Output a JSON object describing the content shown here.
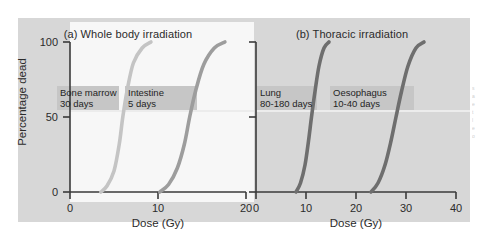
{
  "figure": {
    "y_axis_label": "Percentage dead",
    "y_ticks": [
      "0",
      "50",
      "100"
    ]
  },
  "panel_a": {
    "title": "(a) Whole body irradiation",
    "x_axis_label": "Dose (Gy)",
    "x_ticks": [
      "0",
      "10",
      "20"
    ],
    "curve1_caption": "Bone marrow\n30 days",
    "curve2_caption": "Intestine\n5 days"
  },
  "panel_b": {
    "title": "(b) Thoracic irradiation",
    "x_axis_label": "Dose (Gy)",
    "x_ticks": [
      "0",
      "10",
      "20",
      "30",
      "40"
    ],
    "curve1_caption": "Lung\n80-180 days",
    "curve2_caption": "Oesophagus\n10-40 days"
  },
  "colors": {
    "plate_background": "#d7d7d7",
    "panel_a_background": "#f7f7f7",
    "label_band": "#c6c6c6",
    "axis": "#3a3a3a",
    "curve_bone_marrow": "#c4c4c4",
    "curve_intestine": "#9d9d9d",
    "curve_lung": "#6e6e6e",
    "curve_oesophagus": "#6e6e6e",
    "text": "#2b2b2b"
  },
  "margin_text": [
    "s",
    "a",
    "e",
    "t",
    "l",
    "e",
    "o"
  ],
  "chart_data": {
    "type": "line",
    "panels": [
      {
        "label": "(a) Whole body irradiation",
        "xlabel": "Dose (Gy)",
        "ylabel": "Percentage dead",
        "xlim": [
          0,
          20
        ],
        "ylim": [
          0,
          100
        ],
        "xticks": [
          0,
          10,
          20
        ],
        "yticks": [
          0,
          50,
          100
        ],
        "grid": false,
        "series": [
          {
            "name": "Bone marrow",
            "annotation": "30 days",
            "color": "#c4c4c4",
            "x": [
              3.5,
              4.2,
              5.0,
              5.6,
              6.0,
              6.5,
              7.2,
              8.2,
              9.2
            ],
            "y": [
              0,
              4,
              14,
              32,
              50,
              68,
              86,
              96,
              100
            ]
          },
          {
            "name": "Intestine",
            "annotation": "5 days",
            "color": "#9d9d9d",
            "x": [
              10.2,
              11.2,
              12.2,
              13.0,
              13.6,
              14.3,
              15.2,
              16.4,
              17.6
            ],
            "y": [
              0,
              5,
              16,
              32,
              50,
              68,
              85,
              96,
              100
            ]
          }
        ]
      },
      {
        "label": "(b) Thoracic irradiation",
        "xlabel": "Dose (Gy)",
        "ylabel": "Percentage dead",
        "xlim": [
          0,
          40
        ],
        "ylim": [
          0,
          100
        ],
        "xticks": [
          0,
          10,
          20,
          30,
          40
        ],
        "yticks": [
          0,
          50,
          100
        ],
        "grid": false,
        "series": [
          {
            "name": "Lung",
            "annotation": "80-180 days",
            "color": "#6e6e6e",
            "x": [
              8.0,
              8.9,
              9.8,
              10.5,
              11.1,
              11.8,
              12.6,
              13.6,
              14.6
            ],
            "y": [
              0,
              6,
              18,
              34,
              50,
              67,
              84,
              96,
              100
            ]
          },
          {
            "name": "Oesophagus",
            "annotation": "10-40 days",
            "color": "#6e6e6e",
            "x": [
              23.0,
              24.4,
              25.8,
              27.0,
              28.0,
              29.1,
              30.4,
              32.0,
              33.6
            ],
            "y": [
              0,
              6,
              18,
              34,
              50,
              67,
              84,
              96,
              100
            ]
          }
        ]
      }
    ]
  }
}
